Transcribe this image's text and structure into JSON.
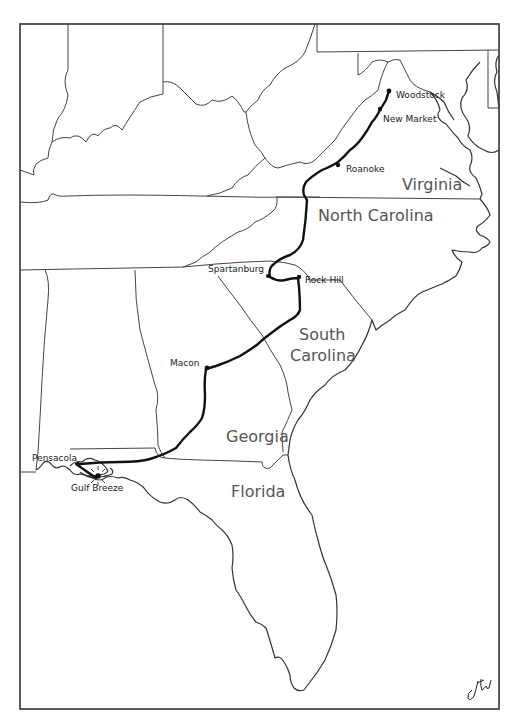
{
  "map": {
    "title": "Route map: Woodstock, VA to Gulf Breeze, FL",
    "states": [
      {
        "name": "Virginia",
        "label": "Virginia"
      },
      {
        "name": "North Carolina",
        "label": "North Carolina"
      },
      {
        "name": "South Carolina",
        "label_line1": "South",
        "label_line2": "Carolina"
      },
      {
        "name": "Georgia",
        "label": "Georgia"
      },
      {
        "name": "Florida",
        "label": "Florida"
      }
    ],
    "cities": [
      {
        "name": "Woodstock",
        "label": "Woodstock"
      },
      {
        "name": "New Market",
        "label": "New Market"
      },
      {
        "name": "Roanoke",
        "label": "Roanoke"
      },
      {
        "name": "Spartanburg",
        "label": "Spartanburg"
      },
      {
        "name": "Rock Hill",
        "label": "Rock Hill"
      },
      {
        "name": "Macon",
        "label": "Macon"
      },
      {
        "name": "Pensacola",
        "label": "Pensacola"
      },
      {
        "name": "Gulf Breeze",
        "label": "Gulf Breeze",
        "marker": "sunburst-destination"
      }
    ],
    "signature": "jtw",
    "colors": {
      "background": "#ffffff",
      "route": "#111111",
      "borders": "#444444",
      "state_labels": "#555555"
    }
  }
}
